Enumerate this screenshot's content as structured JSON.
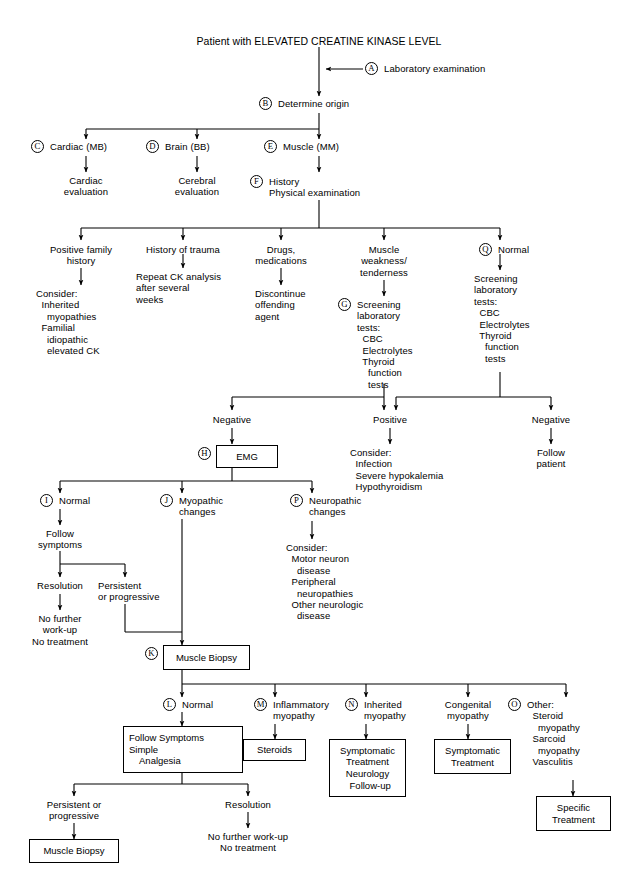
{
  "diagram": {
    "title": "Patient with ELEVATED CREATINE KINASE LEVEL",
    "type": "clinical-algorithm-flowchart"
  },
  "markers": {
    "a": "A",
    "b": "B",
    "c": "C",
    "d": "D",
    "e": "E",
    "f": "F",
    "g": "G",
    "h": "H",
    "i": "I",
    "j": "J",
    "k": "K",
    "l": "L",
    "m": "M",
    "n": "N",
    "o": "O",
    "p": "P",
    "q": "Q"
  },
  "nodes": {
    "lab_exam": "Laboratory examination",
    "determine_origin": "Determine origin",
    "cardiac_mb": "Cardiac (MB)",
    "brain_bb": "Brain (BB)",
    "muscle_mm": "Muscle (MM)",
    "cardiac_eval": "Cardiac\nevaluation",
    "cerebral_eval": "Cerebral\nevaluation",
    "history_pe": "History\nPhysical examination",
    "positive_family_history": "Positive family\nhistory",
    "history_of_trauma": "History of trauma",
    "drugs_medications": "Drugs,\nmedications",
    "muscle_weakness": "Muscle\nweakness/\ntenderness",
    "normal_q": "Normal",
    "consider_inherited": "Consider:\n  Inherited\n    myopathies\n  Familial\n    idiopathic\n    elevated CK",
    "repeat_ck": "Repeat CK analysis\nafter several\nweeks",
    "discontinue_agent": "Discontinue\noffending\nagent",
    "screening_g": "Screening\nlaboratory\ntests:\n  CBC\n  Electrolytes\n  Thyroid\n    function\n    tests",
    "screening_q": "Screening\nlaboratory\ntests:\n  CBC\n  Electrolytes\n  Thyroid\n    function\n    tests",
    "negative_left": "Negative",
    "positive_mid": "Positive",
    "negative_right": "Negative",
    "emg": "EMG",
    "consider_infection": "Consider:\n  Infection\n  Severe hypokalemia\n  Hypothyroidism",
    "follow_patient": "Follow\npatient",
    "normal_i": "Normal",
    "myopathic_changes": "Myopathic\nchanges",
    "neuropathic_changes": "Neuropathic\nchanges",
    "follow_symptoms": "Follow\nsymptoms",
    "consider_motor_neuron": "Consider:\n  Motor neuron\n    disease\n  Peripheral\n    neuropathies\n  Other neurologic\n    disease",
    "resolution_top": "Resolution",
    "persistent_top": "Persistent\nor progressive",
    "no_further_top": "No further\nwork-up\nNo treatment",
    "muscle_biopsy_k": "Muscle Biopsy",
    "normal_l": "Normal",
    "inflammatory_myopathy": "Inflammatory\nmyopathy",
    "inherited_myopathy": "Inherited\nmyopathy",
    "congenital_myopathy": "Congenital\nmyopathy",
    "other_o": "Other:\n  Steroid\n    myopathy\n  Sarcoid\n    myopathy\n  Vasculitis",
    "follow_symptoms_box": "Follow Symptoms\nSimple\n    Analgesia",
    "steroids_box": "Steroids",
    "symptomatic_neuro_box": "Symptomatic\nTreatment\nNeurology\n  Follow-up",
    "symptomatic_box": "Symptomatic\nTreatment",
    "specific_treatment_box": "Specific\nTreatment",
    "persistent_bottom": "Persistent or\nprogressive",
    "resolution_bottom": "Resolution",
    "muscle_biopsy_bottom": "Muscle Biopsy",
    "no_further_bottom": "No further work-up\nNo treatment"
  },
  "colors": {
    "line": "#000000",
    "text": "#000000",
    "background": "#ffffff"
  }
}
